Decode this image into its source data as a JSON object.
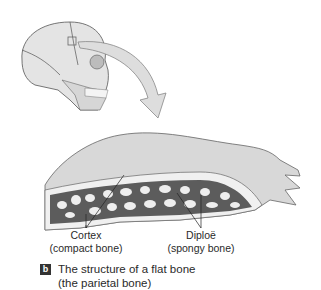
{
  "figure": {
    "panel_letter": "b",
    "caption_line1": "The structure of a flat bone",
    "caption_line2": "(the parietal bone)",
    "labels": [
      {
        "title": "Cortex",
        "subtitle": "(compact bone)"
      },
      {
        "title": "Diploë",
        "subtitle": "(spongy bone)"
      }
    ],
    "colors": {
      "bone_light": "#e6e6e6",
      "bone_dark": "#7a7a7a",
      "arrow_fill": "#dddddd",
      "badge": "#333333"
    }
  }
}
